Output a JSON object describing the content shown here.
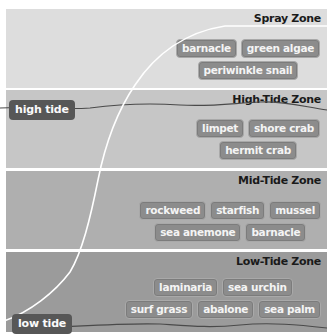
{
  "colors": {
    "spray_bg": "#dddddd",
    "high_bg": "#c6c6c6",
    "mid_bg": "#afafaf",
    "low_bg": "#9b9b9b",
    "tag_bg": "#8c8c8c",
    "tide_label_bg": "#575757",
    "curve": "#ffffff",
    "tide_line": "#4a4a4a"
  },
  "zones": [
    {
      "title": "Spray Zone",
      "rows": [
        [
          "barnacle",
          "green algae"
        ],
        [
          "periwinkle snail"
        ]
      ]
    },
    {
      "title": "High-Tide Zone",
      "rows": [
        [
          "limpet",
          "shore crab"
        ],
        [
          "hermit crab"
        ]
      ]
    },
    {
      "title": "Mid-Tide Zone",
      "rows": [
        [
          "rockweed",
          "starfish",
          "mussel"
        ],
        [
          "sea anemone",
          "barnacle"
        ]
      ]
    },
    {
      "title": "Low-Tide Zone",
      "rows": [
        [
          "laminaria",
          "sea urchin"
        ],
        [
          "surf grass",
          "abalone",
          "sea palm"
        ]
      ]
    }
  ],
  "tide_labels": {
    "high": "high tide",
    "low": "low tide"
  }
}
